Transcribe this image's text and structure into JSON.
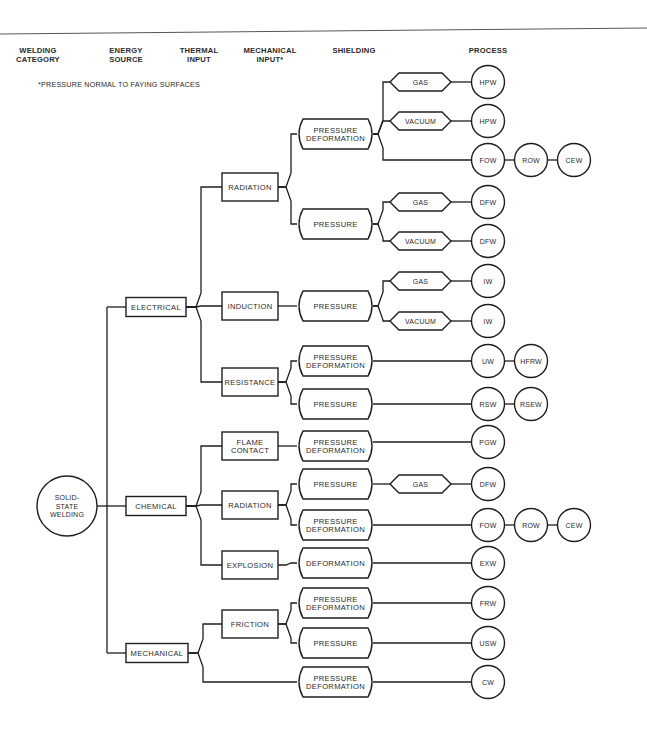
{
  "headers": [
    {
      "id": "welding-category",
      "lines": [
        "WELDING",
        "CATEGORY"
      ],
      "x": 38
    },
    {
      "id": "energy-source",
      "lines": [
        "ENERGY",
        "SOURCE"
      ],
      "x": 126
    },
    {
      "id": "thermal-input",
      "lines": [
        "THERMAL",
        "INPUT"
      ],
      "x": 199
    },
    {
      "id": "mechanical-input",
      "lines": [
        "MECHANICAL",
        "INPUT*"
      ],
      "x": 270
    },
    {
      "id": "shielding",
      "lines": [
        "SHIELDING"
      ],
      "x": 354
    },
    {
      "id": "process",
      "lines": [
        "PROCESS"
      ],
      "x": 488
    }
  ],
  "footnote": "*PRESSURE NORMAL TO FAYING SURFACES",
  "root": {
    "lines": [
      "SOLID-",
      "STATE",
      "WELDING"
    ],
    "cx": 67,
    "cy": 506,
    "r": 30
  },
  "energy_sources": [
    {
      "id": "electrical",
      "label": "ELECTRICAL",
      "cy": 307
    },
    {
      "id": "chemical",
      "label": "CHEMICAL",
      "cy": 506
    },
    {
      "id": "mechanical",
      "label": "MECHANICAL",
      "cy": 653
    }
  ],
  "thermal_inputs": [
    {
      "id": "radiation-electrical",
      "lines": [
        "RADIATION"
      ],
      "cy": 187,
      "parent": 0
    },
    {
      "id": "induction",
      "lines": [
        "INDUCTION"
      ],
      "cy": 306,
      "parent": 0
    },
    {
      "id": "resistance",
      "lines": [
        "RESISTANCE"
      ],
      "cy": 382,
      "parent": 0
    },
    {
      "id": "flame-contact",
      "lines": [
        "FLAME",
        "CONTACT"
      ],
      "cy": 446,
      "parent": 1
    },
    {
      "id": "radiation-chemical",
      "lines": [
        "RADIATION"
      ],
      "cy": 505,
      "parent": 1
    },
    {
      "id": "explosion",
      "lines": [
        "EXPLOSION"
      ],
      "cy": 565,
      "parent": 1
    },
    {
      "id": "friction",
      "lines": [
        "FRICTION"
      ],
      "cy": 624,
      "parent": 2
    }
  ],
  "mechanical_inputs": [
    {
      "id": "mi-1",
      "lines": [
        "PRESSURE",
        "DEFORMATION"
      ],
      "cy": 134,
      "parent_thermal": 0
    },
    {
      "id": "mi-2",
      "lines": [
        "PRESSURE"
      ],
      "cy": 224,
      "parent_thermal": 0
    },
    {
      "id": "mi-3",
      "lines": [
        "PRESSURE"
      ],
      "cy": 306,
      "parent_thermal": 1
    },
    {
      "id": "mi-4",
      "lines": [
        "PRESSURE",
        "DEFORMATION"
      ],
      "cy": 361,
      "parent_thermal": 2
    },
    {
      "id": "mi-5",
      "lines": [
        "PRESSURE"
      ],
      "cy": 404,
      "parent_thermal": 2
    },
    {
      "id": "mi-6",
      "lines": [
        "PRESSURE",
        "DEFORMATION"
      ],
      "cy": 446,
      "parent_thermal": 3
    },
    {
      "id": "mi-7",
      "lines": [
        "PRESSURE"
      ],
      "cy": 484,
      "parent_thermal": 4
    },
    {
      "id": "mi-8",
      "lines": [
        "PRESSURE",
        "DEFORMATION"
      ],
      "cy": 525,
      "parent_thermal": 4
    },
    {
      "id": "mi-9",
      "lines": [
        "DEFORMATION"
      ],
      "cy": 563,
      "parent_thermal": 5
    },
    {
      "id": "mi-10",
      "lines": [
        "PRESSURE",
        "DEFORMATION"
      ],
      "cy": 603,
      "parent_thermal": 6
    },
    {
      "id": "mi-11",
      "lines": [
        "PRESSURE"
      ],
      "cy": 643,
      "parent_thermal": 6
    },
    {
      "id": "mi-12",
      "lines": [
        "PRESSURE",
        "DEFORMATION"
      ],
      "cy": 682,
      "parent_energy": 2
    }
  ],
  "shielding": [
    {
      "id": "sh-1",
      "label": "GAS",
      "cy": 82,
      "parent_mi": 0
    },
    {
      "id": "sh-2",
      "label": "VACUUM",
      "cy": 121,
      "parent_mi": 0
    },
    {
      "id": "sh-3",
      "label": "GAS",
      "cy": 202,
      "parent_mi": 1
    },
    {
      "id": "sh-4",
      "label": "VACUUM",
      "cy": 241,
      "parent_mi": 1
    },
    {
      "id": "sh-5",
      "label": "GAS",
      "cy": 281,
      "parent_mi": 2
    },
    {
      "id": "sh-6",
      "label": "VACUUM",
      "cy": 321,
      "parent_mi": 2
    },
    {
      "id": "sh-7",
      "label": "GAS",
      "cy": 484,
      "parent_mi": 6
    }
  ],
  "processes": [
    {
      "cy": 82,
      "from": "sh-1",
      "circles": [
        "HPW"
      ]
    },
    {
      "cy": 121,
      "from": "sh-2",
      "circles": [
        "HPW"
      ]
    },
    {
      "cy": 160,
      "from": "mi-1",
      "circles": [
        "FOW",
        "ROW",
        "CEW"
      ]
    },
    {
      "cy": 202,
      "from": "sh-3",
      "circles": [
        "DFW"
      ]
    },
    {
      "cy": 241,
      "from": "sh-4",
      "circles": [
        "DFW"
      ]
    },
    {
      "cy": 281,
      "from": "sh-5",
      "circles": [
        "IW"
      ]
    },
    {
      "cy": 321,
      "from": "sh-6",
      "circles": [
        "IW"
      ]
    },
    {
      "cy": 361,
      "from": "mi-4",
      "circles": [
        "UW",
        "HFRW"
      ]
    },
    {
      "cy": 404,
      "from": "mi-5",
      "circles": [
        "RSW",
        "RSEW"
      ]
    },
    {
      "cy": 442,
      "from": "mi-6",
      "circles": [
        "PGW"
      ]
    },
    {
      "cy": 484,
      "from": "sh-7",
      "circles": [
        "DFW"
      ]
    },
    {
      "cy": 525,
      "from": "mi-8",
      "circles": [
        "FOW",
        "ROW",
        "CEW"
      ]
    },
    {
      "cy": 563,
      "from": "mi-9",
      "circles": [
        "EXW"
      ]
    },
    {
      "cy": 603,
      "from": "mi-10",
      "circles": [
        "FRW"
      ]
    },
    {
      "cy": 643,
      "from": "mi-11",
      "circles": [
        "USW"
      ]
    },
    {
      "cy": 682,
      "from": "mi-12",
      "circles": [
        "CW"
      ]
    }
  ],
  "colors": {
    "ink": "#1e1e1e",
    "paper": "#ffffff",
    "text": "#2a2a2a"
  }
}
